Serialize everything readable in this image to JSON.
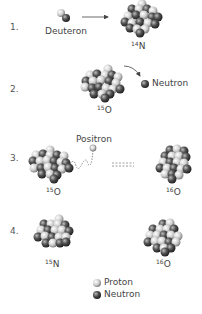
{
  "steps": [
    {
      "number": "1.",
      "particle_label": "Deuteron",
      "product": {
        "mass": "14",
        "symbol": "N"
      }
    },
    {
      "number": "2.",
      "nucleus": {
        "mass": "15",
        "symbol": "O"
      },
      "emitted_label": "Neutron"
    },
    {
      "number": "3.",
      "emitted_label": "Positron",
      "left": {
        "mass": "15",
        "symbol": "O"
      },
      "right": {
        "mass": "16",
        "symbol": "O"
      }
    },
    {
      "number": "4.",
      "left": {
        "mass": "15",
        "symbol": "N"
      },
      "right": {
        "mass": "16",
        "symbol": "O"
      }
    }
  ],
  "legend": {
    "proton": "Proton",
    "neutron": "Neutron"
  },
  "colors": {
    "proton": "#c8c8c8",
    "neutron": "#4a4a4a",
    "text": "#444444"
  }
}
